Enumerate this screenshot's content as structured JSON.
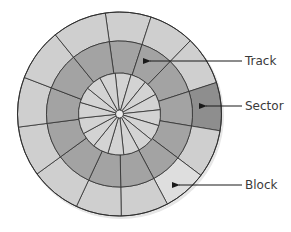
{
  "diagram": {
    "type": "disk-geometry",
    "center": [
      119.5,
      114
    ],
    "radii": {
      "outer": 102,
      "middle": 73,
      "inner": 41,
      "hub": 4
    },
    "colors": {
      "outer_ring": "#cfcfcf",
      "middle_ring": "#a3a3a3",
      "inner_ring": "#d3d3d3",
      "sector_highlight": "#8e8e8e",
      "block_highlight": "#dedede",
      "hub": "#ececec",
      "stroke": "#2e2e2e",
      "arrow": "#1a1a1a",
      "label": "#3a3a3a"
    },
    "outer_dividers_deg": [
      -98,
      -72,
      -46,
      -18,
      9.5,
      37,
      62,
      89,
      115,
      144,
      172.6,
      201,
      231
    ],
    "inner_dividers_deg": [
      -96,
      -73.5,
      -51,
      -28.5,
      -6,
      16.5,
      39,
      61.5,
      84,
      106.5,
      129,
      151.5,
      174,
      196.5,
      219,
      241.5
    ],
    "highlight_cells": {
      "sector": {
        "ring": "outer",
        "from_deg": -18,
        "to_deg": 9.5
      },
      "block": {
        "ring": "outer",
        "from_deg": 37,
        "to_deg": 62
      }
    }
  },
  "labels": [
    {
      "id": "track",
      "text": "Track",
      "x": 245,
      "y": 54,
      "arrow_from": [
        242,
        61
      ],
      "arrow_to": [
        150,
        61
      ]
    },
    {
      "id": "sector",
      "text": "Sector",
      "x": 245,
      "y": 99,
      "arrow_from": [
        242,
        106
      ],
      "arrow_to": [
        206,
        106
      ]
    },
    {
      "id": "block",
      "text": "Block",
      "x": 245,
      "y": 178,
      "arrow_from": [
        242,
        185
      ],
      "arrow_to": [
        179,
        185
      ]
    }
  ]
}
